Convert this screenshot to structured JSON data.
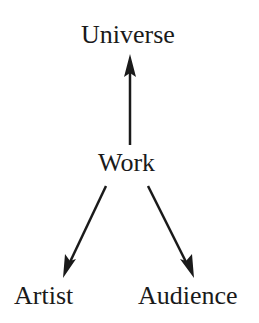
{
  "diagram": {
    "nodes": {
      "universe": "Universe",
      "work": "Work",
      "artist": "Artist",
      "audience": "Audience"
    },
    "edges": [
      {
        "from": "Work",
        "to": "Universe"
      },
      {
        "from": "Work",
        "to": "Artist"
      },
      {
        "from": "Work",
        "to": "Audience"
      }
    ],
    "colors": {
      "stroke": "#1a1a1a",
      "background": "#ffffff"
    }
  }
}
